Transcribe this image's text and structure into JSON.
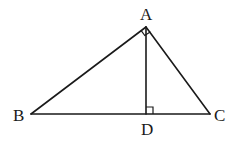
{
  "diagram": {
    "type": "right-triangle-with-altitude",
    "points": {
      "A": {
        "label": "A",
        "x": 146,
        "y": 27
      },
      "B": {
        "label": "B",
        "x": 31,
        "y": 114
      },
      "C": {
        "label": "C",
        "x": 210,
        "y": 114
      },
      "D": {
        "label": "D",
        "x": 146,
        "y": 114
      }
    },
    "segments": [
      "AB",
      "AC",
      "BC",
      "AD"
    ],
    "right_angles": [
      "BAC",
      "ADC"
    ],
    "labels": {
      "A": "A",
      "B": "B",
      "C": "C",
      "D": "D"
    },
    "line_color": "#1a1a1a",
    "background": "#ffffff"
  }
}
